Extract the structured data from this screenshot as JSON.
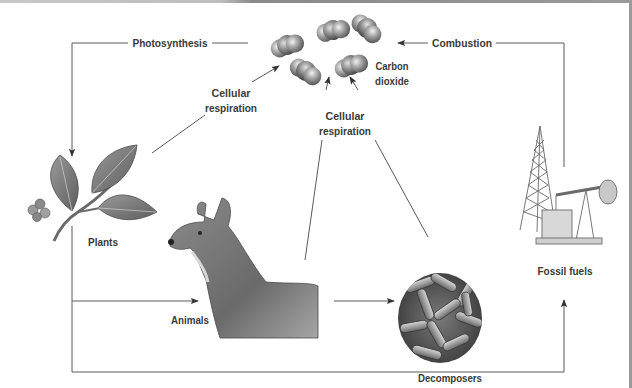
{
  "diagram": {
    "colors": {
      "line": "#5a5a5a",
      "label": "#3c3c3c",
      "molecule": "#8c8c8c",
      "frame": "#9a9a9a"
    },
    "nodes": {
      "carbon_dioxide": {
        "line1": "Carbon",
        "line2": "dioxide",
        "icon": "co2-molecules-icon"
      },
      "plants": {
        "label": "Plants",
        "icon": "leafy-branch-icon"
      },
      "animals": {
        "label": "Animals",
        "icon": "deer-icon"
      },
      "decomposers": {
        "label": "Decomposers",
        "icon": "bacteria-icon"
      },
      "fossil_fuels": {
        "label": "Fossil fuels",
        "icon": "oil-rig-pump-jack-icon"
      }
    },
    "processes": {
      "photosynthesis": "Photosynthesis",
      "combustion": "Combustion",
      "cellular_respiration_plants": {
        "line1": "Cellular",
        "line2": "respiration"
      },
      "cellular_respiration_animals_decomposers": {
        "line1": "Cellular",
        "line2": "respiration"
      }
    },
    "edges": [
      {
        "from": "Carbon dioxide",
        "to": "Plants",
        "label": "Photosynthesis"
      },
      {
        "from": "Plants",
        "to": "Carbon dioxide",
        "label": "Cellular respiration"
      },
      {
        "from": "Animals",
        "to": "Carbon dioxide",
        "label": "Cellular respiration"
      },
      {
        "from": "Decomposers",
        "to": "Carbon dioxide",
        "label": "Cellular respiration"
      },
      {
        "from": "Fossil fuels",
        "to": "Carbon dioxide",
        "label": "Combustion"
      },
      {
        "from": "Plants",
        "to": "Animals",
        "label": ""
      },
      {
        "from": "Animals",
        "to": "Decomposers",
        "label": ""
      },
      {
        "from": "Plants",
        "to": "Fossil fuels",
        "label": ""
      }
    ]
  }
}
